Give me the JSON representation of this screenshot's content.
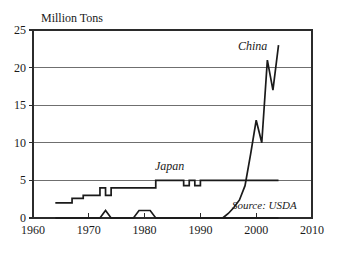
{
  "chart_data": {
    "type": "line",
    "title": "Million Tons",
    "xlabel": "",
    "ylabel": "Million Tons",
    "xlim": [
      1960,
      2010
    ],
    "ylim": [
      0,
      25
    ],
    "grid": true,
    "legend_position": "inline-annotations",
    "x_ticks": [
      "1960",
      "1970",
      "1980",
      "1990",
      "2000",
      "2010"
    ],
    "x_tick_values": [
      1960,
      1970,
      1980,
      1990,
      2000,
      2010
    ],
    "y_ticks": [
      "0",
      "5",
      "10",
      "15",
      "20",
      "25"
    ],
    "y_tick_values": [
      0,
      5,
      10,
      15,
      20,
      25
    ],
    "annotations": [
      {
        "name": "china-label",
        "text": "China",
        "x": 2001,
        "y": 22.2
      },
      {
        "name": "japan-label",
        "text": "Japan",
        "x": 1987,
        "y": 6.6
      },
      {
        "name": "source-note",
        "text": "Source: USDA",
        "x": 2000,
        "y": 1.6
      }
    ],
    "series": [
      {
        "name": "Japan",
        "x": [
          1964,
          1967,
          1967,
          1969,
          1969,
          1971,
          1971,
          1972,
          1972,
          1973,
          1973,
          1974,
          1974,
          1979,
          1979,
          1981,
          1981,
          1982,
          1982,
          1986,
          1986,
          1987,
          1987,
          1988,
          1988,
          1989,
          1989,
          1990,
          1990,
          2004
        ],
        "values": [
          2,
          2,
          2.6,
          2.6,
          3,
          3,
          3,
          3,
          4,
          4,
          3,
          3,
          4,
          4,
          4,
          4,
          4,
          4,
          5,
          5,
          5,
          5,
          4.3,
          4.3,
          5,
          5,
          4.3,
          4.3,
          5,
          5
        ]
      },
      {
        "name": "China",
        "x": [
          1994,
          1995,
          1996,
          1997,
          1998,
          1999,
          2000,
          2001,
          2002,
          2003,
          2004
        ],
        "values": [
          0,
          0.6,
          1.4,
          2.4,
          4.3,
          8.5,
          13,
          10,
          21,
          17,
          23
        ]
      },
      {
        "name": "other",
        "x": [
          1964,
          1972,
          1973,
          1974,
          1978,
          1979,
          1981,
          1982,
          2004
        ],
        "values": [
          0,
          0,
          1,
          0,
          0,
          1,
          1,
          0,
          0
        ]
      }
    ]
  },
  "figure": {
    "background_color": "#ffffff",
    "line_color": "#1a1a1a",
    "grid_color": "#6f6f6f",
    "frame_color": "#2b2b2b"
  }
}
